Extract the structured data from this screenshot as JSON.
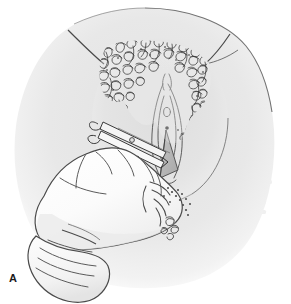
{
  "figure": {
    "panel_label": "A",
    "panel_label_position": {
      "x": 9,
      "y": 279
    },
    "canvas": {
      "width": 291,
      "height": 304
    },
    "background_color": "#ffffff"
  },
  "colors": {
    "paper": "#ffffff",
    "body_fill": "#e6e6e6",
    "body_fill_light": "#efefef",
    "body_fill_deep": "#dcdcdc",
    "glove_fill": "#fcfcfc",
    "glove_shade": "#e9e9e9",
    "ink_line": "#4a4a4a",
    "ink_line_dark": "#2b2b2b",
    "hair_ink": "#262626",
    "incision_wedge": "#b9b9b9",
    "instrument_fill": "#f4f4f4",
    "ghost_text": "#e4e4e4",
    "label_text": "#1a1a1a"
  },
  "regions": [
    {
      "id": "buttocks-field",
      "name": "buttocks-and-thigh-field",
      "description": "Large rounded grey body mass filling upper and middle of frame"
    },
    {
      "id": "perineal-oval",
      "name": "perineal-oval",
      "description": "Oval shaded area centered on the vulva and perineum"
    },
    {
      "id": "pubic-hair",
      "name": "pubic-hair-texture",
      "description": "Dense tangled curly squiggle texture across the mons and labia majora"
    },
    {
      "id": "vulva",
      "name": "vulvar-anatomy",
      "description": "Nested longitudinal curves of labia with urethral meatus dot"
    },
    {
      "id": "incision-wedge",
      "name": "incision-wedge",
      "description": "Shaded triangular wedge marking the mediolateral episiotomy cut"
    },
    {
      "id": "scissors",
      "name": "episiotomy-scissors",
      "description": "Straight blunt-tipped scissors angled into the perineum"
    },
    {
      "id": "gloved-hand",
      "name": "gloved-hand",
      "description": "Operator gloved hand entering from lower left, fingers guarding the perineum"
    },
    {
      "id": "glove-cuff",
      "name": "glove-cuff",
      "description": "Folded glove cuff and wrist at lower left edge"
    },
    {
      "id": "incision-guide",
      "name": "incision-guide-dots",
      "description": "Dotted stipple line indicating intended incision direction"
    },
    {
      "id": "thigh-crease-l",
      "name": "left-thigh-crease",
      "description": "Angled crease line at upper left of the body mass"
    },
    {
      "id": "thigh-crease-r",
      "name": "right-thigh-crease",
      "description": "Angled crease line at upper right of the body mass"
    },
    {
      "id": "ghost-text",
      "name": "page-showthrough-text",
      "description": "Faint illegible text bleeding through from the reverse of the scanned page"
    }
  ],
  "ghost_text_blocks": [
    {
      "x": 196,
      "y": 150,
      "w": 74,
      "h": 4
    },
    {
      "x": 190,
      "y": 160,
      "w": 82,
      "h": 4
    },
    {
      "x": 198,
      "y": 170,
      "w": 68,
      "h": 4
    },
    {
      "x": 192,
      "y": 180,
      "w": 80,
      "h": 4
    },
    {
      "x": 200,
      "y": 190,
      "w": 64,
      "h": 4
    },
    {
      "x": 188,
      "y": 200,
      "w": 78,
      "h": 4
    },
    {
      "x": 196,
      "y": 210,
      "w": 70,
      "h": 4
    },
    {
      "x": 34,
      "y": 92,
      "w": 58,
      "h": 4
    },
    {
      "x": 30,
      "y": 102,
      "w": 66,
      "h": 4
    },
    {
      "x": 36,
      "y": 206,
      "w": 60,
      "h": 4
    },
    {
      "x": 30,
      "y": 216,
      "w": 70,
      "h": 4
    },
    {
      "x": 100,
      "y": 236,
      "w": 86,
      "h": 4
    },
    {
      "x": 106,
      "y": 246,
      "w": 76,
      "h": 4
    }
  ]
}
